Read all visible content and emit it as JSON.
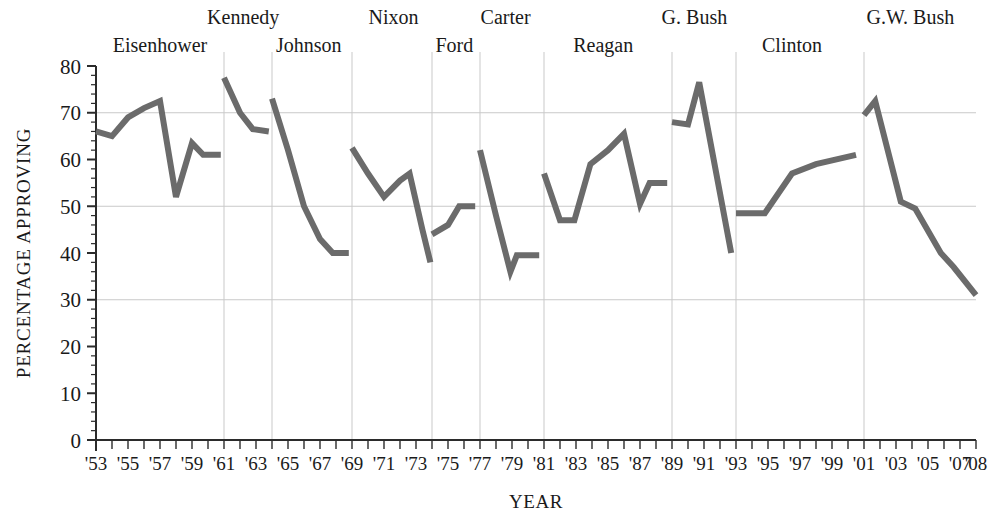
{
  "chart_data": {
    "type": "line",
    "title": "",
    "subtitle": "",
    "xlabel": "YEAR",
    "ylabel": "PERCENTAGE APPROVING",
    "xlim": [
      1953,
      2008
    ],
    "ylim": [
      0,
      80
    ],
    "grid": true,
    "legend_position": "none",
    "line_color": "#6b6b6b",
    "grid_color": "#c9c9c9",
    "axis_color": "#2b2b2b",
    "y_ticks_major": [
      0,
      10,
      20,
      30,
      40,
      50,
      60,
      70,
      80
    ],
    "y_tick_labels": [
      "0",
      "10",
      "20",
      "30",
      "40",
      "50",
      "60",
      "70",
      "80"
    ],
    "y_minor_step": 2,
    "x_tick_labels": [
      {
        "year": 1953,
        "label": "'53"
      },
      {
        "year": 1955,
        "label": "'55"
      },
      {
        "year": 1957,
        "label": "'57"
      },
      {
        "year": 1959,
        "label": "'59"
      },
      {
        "year": 1961,
        "label": "'61"
      },
      {
        "year": 1963,
        "label": "'63"
      },
      {
        "year": 1965,
        "label": "'65"
      },
      {
        "year": 1967,
        "label": "'67"
      },
      {
        "year": 1969,
        "label": "'69"
      },
      {
        "year": 1971,
        "label": "'71"
      },
      {
        "year": 1973,
        "label": "'73"
      },
      {
        "year": 1975,
        "label": "'75"
      },
      {
        "year": 1977,
        "label": "'77"
      },
      {
        "year": 1979,
        "label": "'79"
      },
      {
        "year": 1981,
        "label": "'81"
      },
      {
        "year": 1983,
        "label": "'83"
      },
      {
        "year": 1985,
        "label": "'85"
      },
      {
        "year": 1987,
        "label": "'87"
      },
      {
        "year": 1989,
        "label": "'89"
      },
      {
        "year": 1991,
        "label": "'91"
      },
      {
        "year": 1993,
        "label": "'93"
      },
      {
        "year": 1995,
        "label": "'95"
      },
      {
        "year": 1997,
        "label": "'97"
      },
      {
        "year": 1999,
        "label": "'99"
      },
      {
        "year": 2001,
        "label": "'01"
      },
      {
        "year": 2003,
        "label": "'03"
      },
      {
        "year": 2005,
        "label": "'05"
      },
      {
        "year": 2007,
        "label": "'07"
      },
      {
        "year": 2008,
        "label": "'08"
      }
    ],
    "president_dividers": [
      1961,
      1964,
      1969,
      1974,
      1977,
      1981,
      1989,
      1993,
      2001
    ],
    "presidents": [
      {
        "name": "Eisenhower",
        "label_year": 1957.0,
        "row": 1
      },
      {
        "name": "Kennedy",
        "label_year": 1962.2,
        "row": 0
      },
      {
        "name": "Johnson",
        "label_year": 1966.3,
        "row": 1
      },
      {
        "name": "Nixon",
        "label_year": 1971.6,
        "row": 0
      },
      {
        "name": "Ford",
        "label_year": 1975.4,
        "row": 1
      },
      {
        "name": "Carter",
        "label_year": 1978.6,
        "row": 0
      },
      {
        "name": "Reagan",
        "label_year": 1984.7,
        "row": 1
      },
      {
        "name": "G. Bush",
        "label_year": 1990.4,
        "row": 0
      },
      {
        "name": "Clinton",
        "label_year": 1996.5,
        "row": 1
      },
      {
        "name": "G.W. Bush",
        "label_year": 2003.9,
        "row": 0
      }
    ],
    "series": [
      {
        "name": "Eisenhower",
        "points": [
          {
            "x": 1953.0,
            "y": 66
          },
          {
            "x": 1954.0,
            "y": 65
          },
          {
            "x": 1955.0,
            "y": 69
          },
          {
            "x": 1956.0,
            "y": 71
          },
          {
            "x": 1957.0,
            "y": 72.5
          },
          {
            "x": 1958.0,
            "y": 52
          },
          {
            "x": 1959.0,
            "y": 63.5
          },
          {
            "x": 1959.7,
            "y": 61
          },
          {
            "x": 1960.8,
            "y": 61
          }
        ]
      },
      {
        "name": "Kennedy",
        "points": [
          {
            "x": 1961.0,
            "y": 77.5
          },
          {
            "x": 1962.0,
            "y": 70
          },
          {
            "x": 1962.8,
            "y": 66.5
          },
          {
            "x": 1963.8,
            "y": 66
          }
        ]
      },
      {
        "name": "Johnson",
        "points": [
          {
            "x": 1964.0,
            "y": 73
          },
          {
            "x": 1965.0,
            "y": 62
          },
          {
            "x": 1966.0,
            "y": 50
          },
          {
            "x": 1967.0,
            "y": 43
          },
          {
            "x": 1967.8,
            "y": 40
          },
          {
            "x": 1968.8,
            "y": 40
          }
        ]
      },
      {
        "name": "Nixon",
        "points": [
          {
            "x": 1969.0,
            "y": 62.5
          },
          {
            "x": 1970.0,
            "y": 57
          },
          {
            "x": 1971.0,
            "y": 52
          },
          {
            "x": 1972.0,
            "y": 55.5
          },
          {
            "x": 1972.6,
            "y": 57
          },
          {
            "x": 1973.4,
            "y": 45
          },
          {
            "x": 1973.9,
            "y": 38
          }
        ]
      },
      {
        "name": "Ford",
        "points": [
          {
            "x": 1974.0,
            "y": 44
          },
          {
            "x": 1975.0,
            "y": 46
          },
          {
            "x": 1975.7,
            "y": 50
          },
          {
            "x": 1976.7,
            "y": 50
          }
        ]
      },
      {
        "name": "Carter",
        "points": [
          {
            "x": 1977.0,
            "y": 62
          },
          {
            "x": 1978.0,
            "y": 48
          },
          {
            "x": 1978.9,
            "y": 36
          },
          {
            "x": 1979.3,
            "y": 39.5
          },
          {
            "x": 1980.7,
            "y": 39.5
          }
        ]
      },
      {
        "name": "Reagan",
        "points": [
          {
            "x": 1981.0,
            "y": 57
          },
          {
            "x": 1982.0,
            "y": 47
          },
          {
            "x": 1982.9,
            "y": 47
          },
          {
            "x": 1983.9,
            "y": 59
          },
          {
            "x": 1985.0,
            "y": 62
          },
          {
            "x": 1986.0,
            "y": 65.5
          },
          {
            "x": 1987.0,
            "y": 50.5
          },
          {
            "x": 1987.6,
            "y": 55
          },
          {
            "x": 1988.7,
            "y": 55
          }
        ]
      },
      {
        "name": "G. Bush",
        "points": [
          {
            "x": 1989.0,
            "y": 68
          },
          {
            "x": 1990.0,
            "y": 67.5
          },
          {
            "x": 1990.7,
            "y": 76.5
          },
          {
            "x": 1992.7,
            "y": 40
          }
        ]
      },
      {
        "name": "Clinton",
        "points": [
          {
            "x": 1993.0,
            "y": 48.5
          },
          {
            "x": 1994.8,
            "y": 48.5
          },
          {
            "x": 1996.5,
            "y": 57
          },
          {
            "x": 1998.0,
            "y": 59
          },
          {
            "x": 2000.5,
            "y": 61
          }
        ]
      },
      {
        "name": "G.W. Bush",
        "points": [
          {
            "x": 2001.0,
            "y": 69.5
          },
          {
            "x": 2001.7,
            "y": 72.5
          },
          {
            "x": 2003.3,
            "y": 51
          },
          {
            "x": 2004.2,
            "y": 49.5
          },
          {
            "x": 2005.8,
            "y": 40
          },
          {
            "x": 2006.6,
            "y": 37
          },
          {
            "x": 2008.0,
            "y": 31
          }
        ]
      }
    ]
  }
}
